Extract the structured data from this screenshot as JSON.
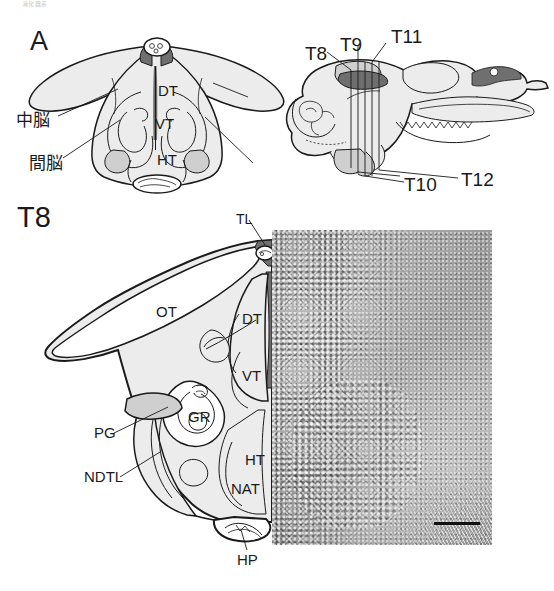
{
  "figure": {
    "header_ghost": "消化器系",
    "panel_a_label": "A",
    "section_label": "T8"
  },
  "panel_a": {
    "name": "coronal-brain-diagram",
    "internal_labels": [
      {
        "id": "DT",
        "text": "DT",
        "x": 158,
        "y": 83
      },
      {
        "id": "VT",
        "text": "VT",
        "x": 155,
        "y": 116
      },
      {
        "id": "HT",
        "text": "HT",
        "x": 157,
        "y": 153
      }
    ],
    "annotation_labels": [
      {
        "id": "midbrain",
        "text": "中脳",
        "x": 17,
        "y": 115
      },
      {
        "id": "diencephalon",
        "text": "間脳",
        "x": 30,
        "y": 158
      }
    ]
  },
  "panel_sagittal": {
    "name": "sagittal-brain-diagram",
    "section_planes": [
      {
        "id": "T8",
        "text": "T8",
        "x": 306,
        "y": 46
      },
      {
        "id": "T9",
        "text": "T9",
        "x": 341,
        "y": 37
      },
      {
        "id": "T11",
        "text": "T11",
        "x": 392,
        "y": 29
      },
      {
        "id": "T10",
        "text": "T10",
        "x": 405,
        "y": 177
      },
      {
        "id": "T12",
        "text": "T12",
        "x": 462,
        "y": 172
      }
    ]
  },
  "panel_t8": {
    "name": "t8-section-drawing",
    "region_labels": [
      {
        "id": "TL",
        "text": "TL",
        "x": 237,
        "y": 214,
        "leader": true
      },
      {
        "id": "OT",
        "text": "OT",
        "x": 157,
        "y": 306,
        "leader": false
      },
      {
        "id": "DT",
        "text": "DT",
        "x": 243,
        "y": 313,
        "leader": false
      },
      {
        "id": "VT",
        "text": "VT",
        "x": 243,
        "y": 370,
        "leader": false
      },
      {
        "id": "GR",
        "text": "GR",
        "x": 189,
        "y": 411,
        "leader": false
      },
      {
        "id": "PG",
        "text": "PG",
        "x": 95,
        "y": 430,
        "leader": true
      },
      {
        "id": "NDTL",
        "text": "NDTL",
        "x": 85,
        "y": 474,
        "leader": true
      },
      {
        "id": "HT",
        "text": "HT",
        "x": 246,
        "y": 455,
        "leader": false
      },
      {
        "id": "NAT",
        "text": "NAT",
        "x": 232,
        "y": 484,
        "leader": false
      },
      {
        "id": "HP",
        "text": "HP",
        "x": 238,
        "y": 556,
        "leader": true
      }
    ]
  },
  "micrograph": {
    "name": "histology-micrograph",
    "scale_bar_present": true,
    "scale_bar_text": ""
  },
  "colors": {
    "ink": "#1a1a1a",
    "tissue_light": "#e9e9e9",
    "tissue_mid": "#c8c8c8",
    "tissue_dark": "#6e6e6e",
    "ventricle": "#5a5a5a",
    "background": "#ffffff",
    "micrograph_base": "#9c9c9c"
  }
}
